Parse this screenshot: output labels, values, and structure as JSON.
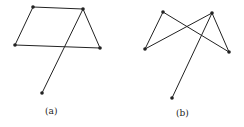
{
  "figures": [
    {
      "label": "(a)",
      "vertices": [
        [
          33,
          7
        ],
        [
          83,
          9
        ],
        [
          15,
          45
        ],
        [
          100,
          48
        ],
        [
          42,
          93
        ]
      ],
      "edges": [
        [
          0,
          1
        ],
        [
          0,
          2
        ],
        [
          2,
          3
        ],
        [
          1,
          3
        ],
        [
          1,
          4
        ]
      ]
    },
    {
      "label": "(b)",
      "vertices": [
        [
          163,
          12
        ],
        [
          212,
          13
        ],
        [
          145,
          49
        ],
        [
          229,
          52
        ],
        [
          172,
          98
        ]
      ],
      "edges": [
        [
          0,
          2
        ],
        [
          0,
          3
        ],
        [
          1,
          2
        ],
        [
          1,
          3
        ],
        [
          1,
          4
        ]
      ]
    }
  ],
  "colors": {
    "stroke": "#222222",
    "background": "#ffffff"
  }
}
